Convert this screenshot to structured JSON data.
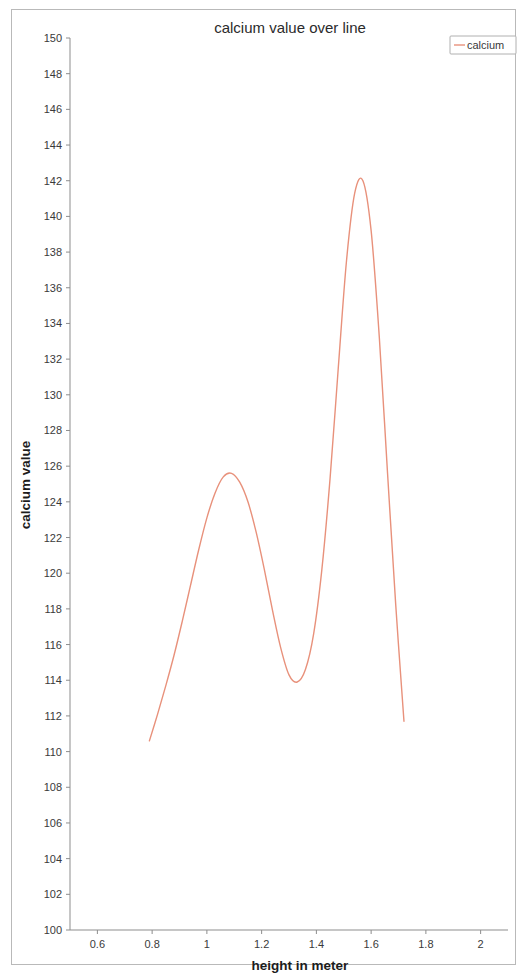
{
  "chart_data": {
    "type": "line",
    "title": "calcium value over line",
    "xlabel": "height in meter",
    "ylabel": "calcium value",
    "xlim": [
      0.5,
      2.1
    ],
    "ylim": [
      100,
      150
    ],
    "grid": false,
    "legend_position": "top-right",
    "x_ticks": [
      "0.6",
      "0.8",
      "1",
      "1.2",
      "1.4",
      "1.6",
      "1.8",
      "2"
    ],
    "x_tick_values": [
      0.6,
      0.8,
      1.0,
      1.2,
      1.4,
      1.6,
      1.8,
      2.0
    ],
    "y_ticks": [
      "100",
      "102",
      "104",
      "106",
      "108",
      "110",
      "112",
      "114",
      "116",
      "118",
      "120",
      "122",
      "124",
      "126",
      "128",
      "130",
      "132",
      "134",
      "136",
      "138",
      "140",
      "142",
      "144",
      "146",
      "148",
      "150"
    ],
    "y_tick_values": [
      100,
      102,
      104,
      106,
      108,
      110,
      112,
      114,
      116,
      118,
      120,
      122,
      124,
      126,
      128,
      130,
      132,
      134,
      136,
      138,
      140,
      142,
      144,
      146,
      148,
      150
    ],
    "series": [
      {
        "name": "calcium",
        "color": "#e8917b",
        "x": [
          0.79,
          0.82,
          0.85,
          0.88,
          0.91,
          0.94,
          0.97,
          1.0,
          1.03,
          1.06,
          1.09,
          1.12,
          1.15,
          1.18,
          1.21,
          1.24,
          1.27,
          1.3,
          1.33,
          1.36,
          1.39,
          1.42,
          1.45,
          1.48,
          1.51,
          1.54,
          1.57,
          1.6,
          1.63,
          1.66,
          1.69,
          1.72
        ],
        "values": [
          110.6,
          112.1,
          113.7,
          115.4,
          117.3,
          119.3,
          121.3,
          123.1,
          124.5,
          125.4,
          125.6,
          125.1,
          124.0,
          122.3,
          120.2,
          117.9,
          115.8,
          114.3,
          113.9,
          114.6,
          116.6,
          120.2,
          125.3,
          131.5,
          137.5,
          141.3,
          142.0,
          139.2,
          133.2,
          125.6,
          118.2,
          111.7
        ]
      }
    ],
    "annotations": {
      "peak_1": {
        "x": 1.09,
        "y": 125.6
      },
      "trough": {
        "x": 1.31,
        "y": 113.9
      },
      "peak_2": {
        "x": 1.54,
        "y": 142.0
      }
    }
  },
  "legend": {
    "entries": [
      {
        "label": "calcium",
        "color": "#e8917b"
      }
    ]
  }
}
